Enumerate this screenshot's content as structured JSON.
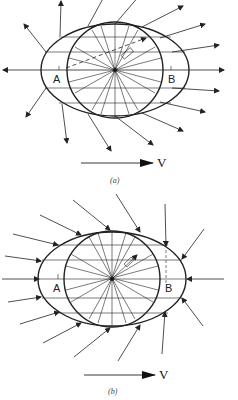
{
  "figure_a": {
    "caption": "(a)",
    "point_left": "A",
    "point_right": "B",
    "velocity_label": "V",
    "arrows": "outward"
  },
  "figure_b": {
    "caption": "(b)",
    "point_left": "A",
    "point_right": "B",
    "velocity_label": "V",
    "arrows": "inward"
  },
  "colors": {
    "line": "#222222",
    "background": "#ffffff"
  }
}
